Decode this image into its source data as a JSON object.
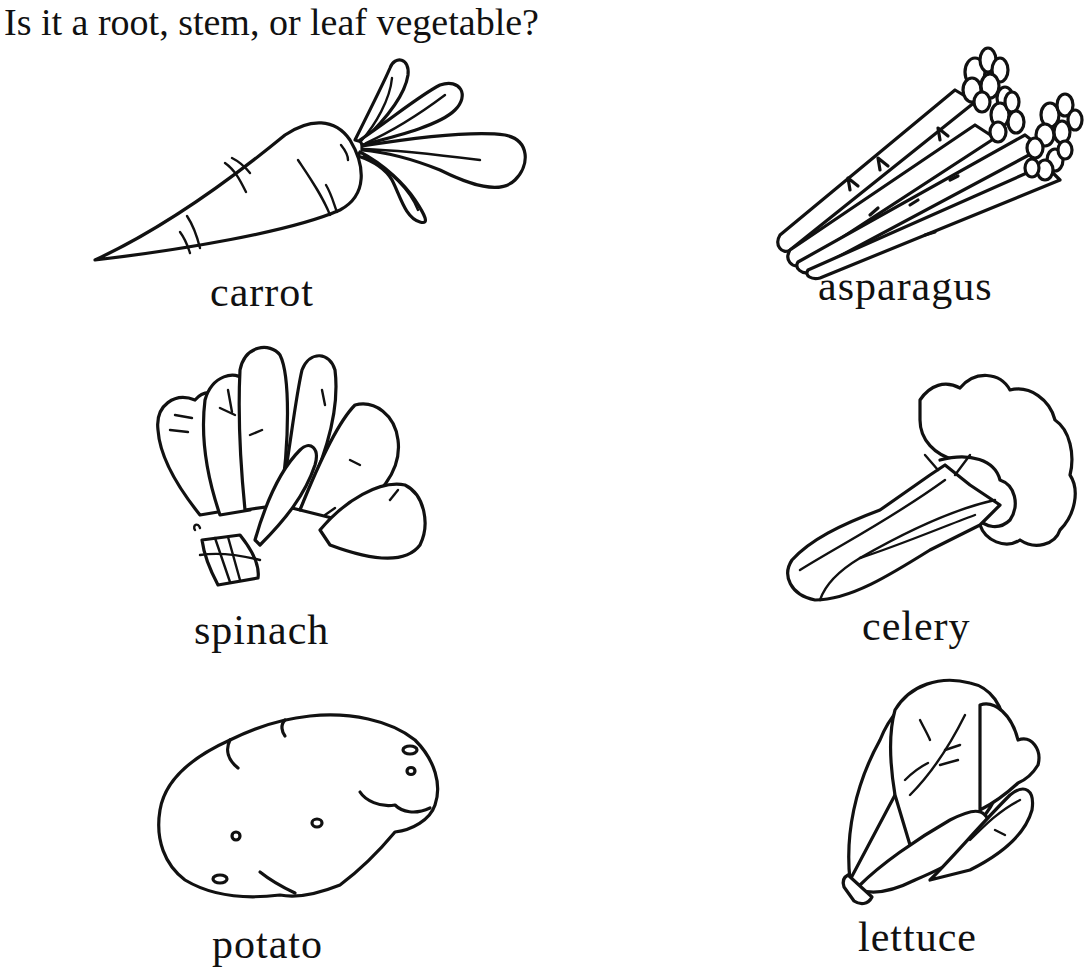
{
  "worksheet": {
    "title": "Is it a root, stem, or leaf vegetable?",
    "items": [
      {
        "label": "carrot",
        "icon": "carrot-icon"
      },
      {
        "label": "asparagus",
        "icon": "asparagus-icon"
      },
      {
        "label": "spinach",
        "icon": "spinach-icon"
      },
      {
        "label": "celery",
        "icon": "celery-icon"
      },
      {
        "label": "potato",
        "icon": "potato-icon"
      },
      {
        "label": "lettuce",
        "icon": "lettuce-icon"
      }
    ],
    "colors": {
      "background": "#ffffff",
      "ink": "#111111"
    }
  }
}
